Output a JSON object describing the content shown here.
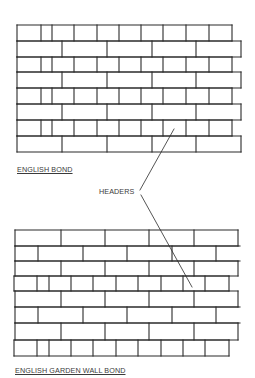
{
  "diagram": {
    "stroke_color": "#2a2a2a",
    "background": "#ffffff",
    "labels": {
      "top_wall": "ENGLISH BOND",
      "headers_callout": "HEADERS",
      "bottom_wall": "ENGLISH GARDEN WALL BOND"
    },
    "walls": [
      {
        "name": "english-bond-wall",
        "rows_y": [
          25,
          41,
          57,
          72,
          88,
          104,
          120,
          136,
          152
        ],
        "row_types": [
          "header",
          "stretcher",
          "header",
          "stretcher",
          "header",
          "stretcher",
          "header",
          "stretcher"
        ],
        "row_x": {
          "header": [
            17,
            41,
            52,
            74,
            97,
            119,
            141,
            163,
            186,
            209,
            232
          ],
          "stretcher": [
            17,
            62,
            107,
            152,
            196,
            241
          ]
        }
      },
      {
        "name": "english-garden-wall-bond-wall",
        "rows_y": [
          230,
          246,
          261,
          276,
          291,
          307,
          323,
          340,
          356
        ],
        "row_types": [
          "stretcher",
          "offset",
          "stretcher",
          "header",
          "stretcher",
          "offset",
          "stretcher",
          "header"
        ],
        "row_x": {
          "stretcher": [
            15,
            61,
            105,
            149,
            194,
            238
          ],
          "offset": [
            15,
            38,
            83,
            127,
            172,
            216,
            240
          ],
          "header": [
            14,
            37,
            49,
            71,
            93,
            116,
            138,
            161,
            183,
            205,
            229
          ]
        }
      }
    ],
    "leader_lines": [
      {
        "x1": 140,
        "y1": 190,
        "x2": 174,
        "y2": 129
      },
      {
        "x1": 141,
        "y1": 195,
        "x2": 192,
        "y2": 287
      }
    ]
  }
}
